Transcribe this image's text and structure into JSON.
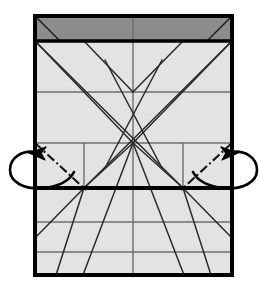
{
  "diagram": {
    "type": "origami-fold-diagram",
    "canvas": {
      "width": 259,
      "height": 289
    },
    "colors": {
      "background": "#ffffff",
      "paper_fill": "#e3e3e3",
      "flap_fill": "#8c8c8c",
      "outline": "#000000",
      "crease_line": "#3a3a3a",
      "grid_line": "#6e6e6e",
      "arrow": "#000000"
    },
    "sheet": {
      "label": "paper-sheet",
      "left": 35,
      "top": 16,
      "right": 232,
      "bottom": 275,
      "border_width": 4
    },
    "flap": {
      "label": "folded-top-flap",
      "left": 35,
      "top": 16,
      "right": 232,
      "bottom": 41,
      "fill": "#8c8c8c"
    },
    "fold_edge": {
      "label": "horizontal-fold-edge",
      "y": 188,
      "x1": 35,
      "x2": 232,
      "width": 4
    },
    "grid": {
      "horizontal_lines": [
        {
          "y": 92,
          "x1": 35,
          "x2": 232
        },
        {
          "y": 143,
          "x1": 35,
          "x2": 232
        },
        {
          "y": 222,
          "x1": 35,
          "x2": 232
        },
        {
          "y": 252,
          "x1": 35,
          "x2": 232
        }
      ],
      "vertical_lines": [
        {
          "x": 84,
          "y1": 143,
          "y2": 188
        },
        {
          "x": 133,
          "y1": 16,
          "y2": 275
        },
        {
          "x": 183,
          "y1": 143,
          "y2": 188
        }
      ]
    },
    "convergence_points": [
      {
        "name": "upper-node",
        "x": 133,
        "y": 92
      },
      {
        "name": "center-node",
        "x": 133,
        "y": 143
      },
      {
        "name": "left-fold-node",
        "x": 84,
        "y": 188
      },
      {
        "name": "right-fold-node",
        "x": 183,
        "y": 188
      }
    ],
    "crease_lines": [
      {
        "name": "crease-tl-diagonal-long",
        "x1": 35,
        "y1": 41,
        "x2": 183,
        "y2": 188
      },
      {
        "name": "crease-tr-diagonal-long",
        "x1": 232,
        "y1": 41,
        "x2": 84,
        "y2": 188
      },
      {
        "name": "crease-center-to-tl",
        "x1": 133,
        "y1": 143,
        "x2": 35,
        "y2": 41
      },
      {
        "name": "crease-center-to-tr",
        "x1": 133,
        "y1": 143,
        "x2": 232,
        "y2": 41
      },
      {
        "name": "crease-upper-to-left",
        "x1": 133,
        "y1": 92,
        "x2": 84,
        "y2": 41
      },
      {
        "name": "crease-upper-to-right",
        "x1": 133,
        "y1": 92,
        "x2": 183,
        "y2": 41
      },
      {
        "name": "crease-steep-left-up",
        "x1": 105,
        "y1": 60,
        "x2": 160,
        "y2": 165
      },
      {
        "name": "crease-steep-right-up",
        "x1": 160,
        "y1": 60,
        "x2": 105,
        "y2": 165
      },
      {
        "name": "crease-center-down-left",
        "x1": 133,
        "y1": 143,
        "x2": 83,
        "y2": 275
      },
      {
        "name": "crease-center-down-right",
        "x1": 133,
        "y1": 143,
        "x2": 184,
        "y2": 275
      },
      {
        "name": "crease-left-node-down",
        "x1": 84,
        "y1": 188,
        "x2": 35,
        "y2": 238
      },
      {
        "name": "crease-left-node-steep",
        "x1": 84,
        "y1": 188,
        "x2": 56,
        "y2": 275
      },
      {
        "name": "crease-right-node-down",
        "x1": 183,
        "y1": 188,
        "x2": 232,
        "y2": 238
      },
      {
        "name": "crease-right-node-steep",
        "x1": 183,
        "y1": 188,
        "x2": 211,
        "y2": 275
      },
      {
        "name": "crease-left-node-up",
        "x1": 84,
        "y1": 188,
        "x2": 133,
        "y2": 143
      },
      {
        "name": "crease-right-node-up",
        "x1": 183,
        "y1": 188,
        "x2": 133,
        "y2": 143
      }
    ],
    "flap_creases": [
      {
        "name": "flap-crease-left",
        "x1": 35,
        "y1": 16,
        "x2": 60,
        "y2": 41
      },
      {
        "name": "flap-crease-right",
        "x1": 232,
        "y1": 16,
        "x2": 207,
        "y2": 41
      }
    ],
    "valley_folds": [
      {
        "name": "valley-fold-left",
        "x1": 35,
        "y1": 143,
        "x2": 84,
        "y2": 188,
        "style": "dash-dot"
      },
      {
        "name": "valley-fold-right",
        "x1": 232,
        "y1": 143,
        "x2": 183,
        "y2": 188,
        "style": "dash-dot"
      }
    ],
    "arrows": [
      {
        "name": "fold-behind-arrow-left",
        "side": "left",
        "meaning": "fold corner behind / turn over",
        "tip_x": 42,
        "tip_y": 155
      },
      {
        "name": "fold-behind-arrow-right",
        "side": "right",
        "meaning": "fold corner behind / turn over",
        "tip_x": 225,
        "tip_y": 155
      }
    ]
  }
}
